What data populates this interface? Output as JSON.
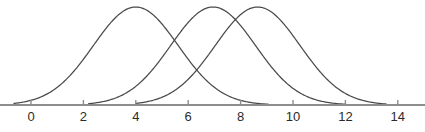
{
  "figure": {
    "title": "",
    "background_color": "#ffffff",
    "width": 425,
    "height": 132
  },
  "chart_data": {
    "type": "line",
    "title": "",
    "subtitle": "",
    "xlabel": "",
    "ylabel": "",
    "grid": false,
    "legend": "none",
    "axis": {
      "orientation": "horizontal",
      "xlim": [
        -0.9,
        14.6
      ],
      "ticks": [
        0,
        2,
        4,
        6,
        8,
        10,
        12,
        14
      ],
      "tick_labels": [
        "0",
        "2",
        "4",
        "6",
        "8",
        "10",
        "12",
        "14"
      ],
      "tick_color": "#8d8d8d",
      "label_color": "#2b2b2b",
      "axis_color": "#8d8d8d",
      "baseline_y_px": 105,
      "x0_px": 31,
      "px_per_unit": 26.2
    },
    "curve_color": "#4a4a4a",
    "series": [
      {
        "name": "curve-1",
        "shape": "normal",
        "mean": 4.0,
        "sigma": 1.62,
        "peak_value": 4.0,
        "peak_height_px": 98,
        "x_start": -0.65,
        "x_end": 9.05,
        "values": [
          0.0,
          0.02,
          0.09,
          0.28,
          0.62,
          0.92,
          1.0,
          0.92,
          0.62,
          0.28,
          0.09,
          0.02,
          0.0
        ]
      },
      {
        "name": "curve-2",
        "shape": "normal",
        "mean": 6.95,
        "sigma": 1.62,
        "peak_value": 6.95,
        "peak_height_px": 98,
        "x_start": 2.2,
        "x_end": 12.0,
        "values": [
          0.0,
          0.02,
          0.09,
          0.28,
          0.62,
          0.92,
          1.0,
          0.92,
          0.62,
          0.28,
          0.09,
          0.02,
          0.0
        ]
      },
      {
        "name": "curve-3",
        "shape": "normal",
        "mean": 8.65,
        "sigma": 1.62,
        "peak_value": 8.65,
        "peak_height_px": 98,
        "x_start": 4.0,
        "x_end": 13.55,
        "values": [
          0.0,
          0.02,
          0.09,
          0.28,
          0.62,
          0.92,
          1.0,
          0.92,
          0.62,
          0.28,
          0.09,
          0.02,
          0.0
        ]
      }
    ]
  }
}
